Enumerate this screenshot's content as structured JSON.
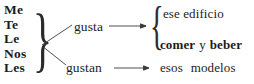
{
  "diagram": {
    "type": "grammar-tree",
    "pronouns": [
      {
        "label": "Me"
      },
      {
        "label": "Te"
      },
      {
        "label": "Le"
      },
      {
        "label": "Nos"
      },
      {
        "label": "Les"
      }
    ],
    "verbs": [
      {
        "label": "gusta"
      },
      {
        "label": "gustan"
      }
    ],
    "targets": [
      {
        "label": "ese edificio"
      },
      {
        "label_bold_1": "comer",
        "label_plain": "y",
        "label_bold_2": "beber"
      },
      {
        "label_word_1": "esos",
        "label_word_2": "modelos"
      }
    ],
    "braces": {
      "left": "}",
      "right": "{"
    },
    "colors": {
      "ink": "#1c1c1c",
      "line": "#3a3a3a",
      "background": "#ffffff"
    }
  }
}
